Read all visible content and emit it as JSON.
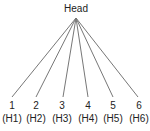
{
  "head": {
    "label": "Head"
  },
  "children": [
    {
      "number": "1",
      "code": "(H1)"
    },
    {
      "number": "2",
      "code": "(H2)"
    },
    {
      "number": "3",
      "code": "(H3)"
    },
    {
      "number": "4",
      "code": "(H4)"
    },
    {
      "number": "5",
      "code": "(H5)"
    },
    {
      "number": "6",
      "code": "(H6)"
    }
  ],
  "colors": {
    "line": "#777777",
    "text": "#222222"
  }
}
